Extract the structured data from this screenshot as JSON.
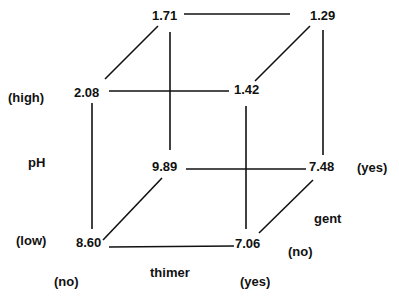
{
  "cube": {
    "vertices": {
      "back_top_left": "1.71",
      "back_top_right": "1.29",
      "front_top_left": "2.08",
      "front_top_right": "1.42",
      "back_bottom_left": "9.89",
      "back_bottom_right": "7.48",
      "front_bottom_left": "8.60",
      "front_bottom_right": "7.06"
    },
    "axes": {
      "ph": {
        "label": "pH",
        "high": "(high)",
        "low": "(low)"
      },
      "thimer": {
        "label": "thimer",
        "no": "(no)",
        "yes": "(yes)"
      },
      "gent": {
        "label": "gent",
        "no": "(no)",
        "yes": "(yes)"
      }
    }
  }
}
